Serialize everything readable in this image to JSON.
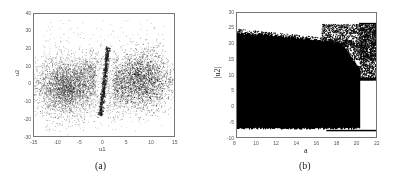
{
  "chart_data": [
    {
      "id": "a",
      "type": "scatter",
      "caption": "(a)",
      "title": "",
      "xlabel": "u1",
      "ylabel": "u2",
      "xlim": [
        -15,
        15
      ],
      "ylim": [
        -30,
        40
      ],
      "xticks": [
        -15,
        -10,
        -5,
        0,
        5,
        10,
        15
      ],
      "yticks": [
        40,
        30,
        20,
        10,
        0,
        -10,
        -20,
        -30
      ],
      "grid": false,
      "legend": null,
      "description": "Two dense clusters of points centered near (-8, -2) and (8, 2), with a thin diagonal streak through the origin from about (-0.5,-18) to (0.5,20) and sparse outliers.",
      "clusters": [
        {
          "cx": -8,
          "cy": -2,
          "sx": 3.2,
          "sy": 8,
          "n": 3200
        },
        {
          "cx": 8,
          "cy": 2,
          "sx": 3.2,
          "sy": 8,
          "n": 3200
        },
        {
          "cx": -2.5,
          "cy": 5,
          "sx": 1.5,
          "sy": 7,
          "n": 500
        },
        {
          "cx": 2.5,
          "cy": -3,
          "sx": 1.5,
          "sy": 7,
          "n": 500
        }
      ],
      "streak": {
        "x0": -0.8,
        "y0": -18,
        "x1": 0.8,
        "y1": 21,
        "n": 700
      },
      "outliers": 250,
      "point_color": "#111111"
    },
    {
      "id": "b",
      "type": "scatter",
      "caption": "(b)",
      "title": "",
      "xlabel": "a",
      "ylabel": "|u2|",
      "xlim": [
        8,
        22
      ],
      "ylim": [
        -10,
        30
      ],
      "xticks": [
        8,
        10,
        12,
        14,
        16,
        18,
        20,
        22
      ],
      "yticks": [
        30,
        25,
        20,
        15,
        10,
        5,
        0,
        -5,
        -10
      ],
      "grid": false,
      "legend": null,
      "description": "Bifurcation-style diagram: solid dense band from a=8 to a≈20.3 spanning roughly -7 to 23 (upper edge declining to ~20 near a=18); sparse region above between a≈16.5 and 22 up to ~26.5; for a>20.3 points lie between ~8.5 and 26.5 plus a thin line at ~-8.",
      "dense_band": {
        "a_start": 8,
        "a_end": 20.3,
        "lower": -7,
        "upper_start": 23,
        "upper_end": 19
      },
      "sparse_top": {
        "a_start": 16.5,
        "a_end": 22,
        "lower": 15,
        "upper": 26.5
      },
      "right_region": {
        "a_start": 20.3,
        "a_end": 22,
        "lower": 8.5,
        "upper": 26.5
      },
      "bottom_line": {
        "a_start": 17,
        "a_end": 22,
        "value": -8
      },
      "point_color": "#000000"
    }
  ]
}
